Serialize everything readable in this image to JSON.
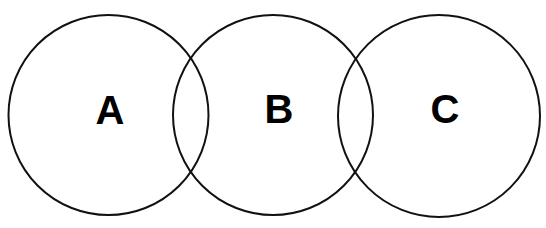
{
  "diagram": {
    "type": "venn",
    "background": "#ffffff",
    "stroke_color": "#111111",
    "sets": [
      {
        "label": "A",
        "cx": 108.5,
        "cy": 115,
        "r": 100
      },
      {
        "label": "B",
        "cx": 273,
        "cy": 115,
        "r": 100
      },
      {
        "label": "C",
        "cx": 439,
        "cy": 116,
        "r": 101
      }
    ]
  }
}
